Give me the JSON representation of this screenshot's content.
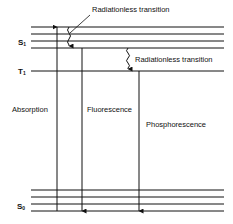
{
  "diagram": {
    "type": "Jablonski energy level diagram",
    "states": {
      "s1": {
        "label": "S",
        "subscript": "1"
      },
      "t1": {
        "label": "T",
        "subscript": "1"
      },
      "s0": {
        "label": "S",
        "subscript": "0"
      }
    },
    "transitions": {
      "absorption": "Absorption",
      "fluorescence": "Fluorescence",
      "phosphorescence": "Phosphorescence",
      "radiationless_top": "Radiationless transition",
      "radiationless_isc": "Radiationless transition"
    },
    "colors": {
      "line": "#111111",
      "background": "#ffffff"
    }
  }
}
